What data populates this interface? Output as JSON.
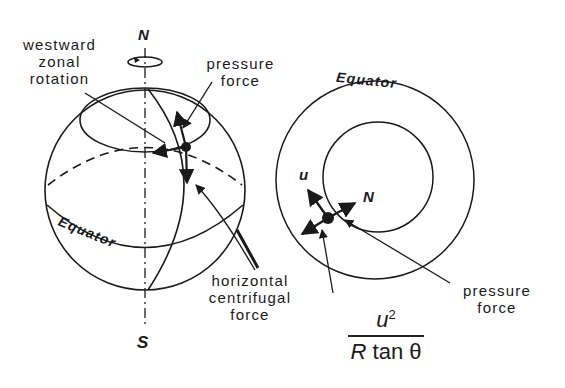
{
  "globe": {
    "north_label": "N",
    "south_label": "S",
    "equator_label": "Equator",
    "labels": {
      "westward_zonal_rotation": [
        "westward",
        "zonal",
        "rotation"
      ],
      "pressure_force": [
        "pressure",
        "force"
      ],
      "horizontal_centrifugal_force": [
        "horizontal",
        "centrifugal",
        "force"
      ]
    }
  },
  "polar_view": {
    "equator_label": "Equator",
    "u_label": "u",
    "n_label": "N",
    "pressure_force": [
      "pressure",
      "force"
    ],
    "formula": {
      "numerator": "u",
      "exponent": "2",
      "denominator_R": "R",
      "denominator_rest": " tan θ"
    }
  },
  "colors": {
    "ink": "#1a1a1a",
    "background": "#ffffff"
  }
}
